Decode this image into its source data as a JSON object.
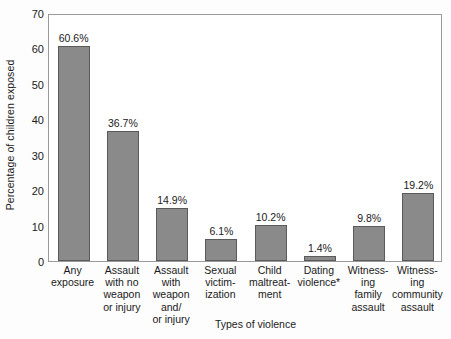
{
  "chart_data": {
    "type": "bar",
    "title": "",
    "xlabel": "Types of violence",
    "ylabel": "Percentage of children exposed",
    "ylim": [
      0,
      70
    ],
    "ytick_step": 10,
    "yticks": [
      70,
      60,
      50,
      40,
      30,
      20,
      10,
      0
    ],
    "grid": false,
    "legend": "none",
    "bar_color": "#8a8a8a",
    "bar_edge_color": "#5a5a5a",
    "frame_color": "#9a9a9a",
    "value_label_suffix": "%",
    "footnote_marker": "*",
    "categories": [
      "Any exposure",
      "Assault with no weapon or injury",
      "Assault with weapon and/ or injury",
      "Sexual victim- ization",
      "Child maltreat- ment",
      "Dating violence*",
      "Witness- ing family assault",
      "Witness- ing community assault"
    ],
    "category_lines": [
      [
        "Any",
        "exposure"
      ],
      [
        "Assault",
        "with no",
        "weapon",
        "or injury"
      ],
      [
        "Assault",
        "with",
        "weapon",
        "and/",
        "or injury"
      ],
      [
        "Sexual",
        "victim-",
        "ization"
      ],
      [
        "Child",
        "maltreat-",
        "ment"
      ],
      [
        "Dating",
        "violence*"
      ],
      [
        "Witness-",
        "ing",
        "family",
        "assault"
      ],
      [
        "Witness-",
        "ing",
        "community",
        "assault"
      ]
    ],
    "values": [
      60.6,
      36.7,
      14.9,
      6.1,
      10.2,
      1.4,
      9.8,
      19.2
    ],
    "value_labels": [
      "60.6%",
      "36.7%",
      "14.9%",
      "6.1%",
      "10.2%",
      "1.4%",
      "9.8%",
      "19.2%"
    ]
  }
}
